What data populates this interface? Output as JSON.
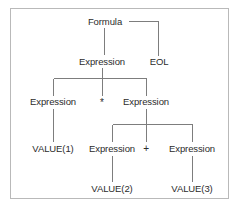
{
  "diagram": {
    "type": "parse-tree",
    "title": "",
    "border_color": "#b9b9b9",
    "line_color": "#7d7d7d",
    "text_color": "#2b2b2b",
    "background": "#ffffff",
    "nodes": [
      {
        "id": "formula",
        "label": "Formula",
        "x": 105,
        "y": 21
      },
      {
        "id": "eol",
        "label": "EOL",
        "x": 159,
        "y": 61
      },
      {
        "id": "expr_root",
        "label": "Expression",
        "x": 102,
        "y": 61
      },
      {
        "id": "expr_left",
        "label": "Expression",
        "x": 53,
        "y": 101
      },
      {
        "id": "op_mul",
        "label": "*",
        "x": 102,
        "y": 102
      },
      {
        "id": "expr_right",
        "label": "Expression",
        "x": 146,
        "y": 101
      },
      {
        "id": "value1",
        "label": "VALUE(1)",
        "x": 53,
        "y": 148
      },
      {
        "id": "expr_add_l",
        "label": "Expression",
        "x": 112,
        "y": 148
      },
      {
        "id": "op_plus",
        "label": "+",
        "x": 146,
        "y": 148
      },
      {
        "id": "expr_add_r",
        "label": "Expression",
        "x": 192,
        "y": 148
      },
      {
        "id": "value2",
        "label": "VALUE(2)",
        "x": 112,
        "y": 188
      },
      {
        "id": "value3",
        "label": "VALUE(3)",
        "x": 192,
        "y": 188
      }
    ],
    "edges": [
      {
        "from": "formula",
        "to": "eol"
      },
      {
        "from": "formula",
        "to": "expr_root"
      },
      {
        "from": "expr_root",
        "to": "expr_left"
      },
      {
        "from": "expr_root",
        "to": "op_mul"
      },
      {
        "from": "expr_root",
        "to": "expr_right"
      },
      {
        "from": "expr_left",
        "to": "value1"
      },
      {
        "from": "expr_right",
        "to": "expr_add_l"
      },
      {
        "from": "expr_right",
        "to": "op_plus"
      },
      {
        "from": "expr_right",
        "to": "expr_add_r"
      },
      {
        "from": "expr_add_l",
        "to": "value2"
      },
      {
        "from": "expr_add_r",
        "to": "value3"
      }
    ]
  }
}
